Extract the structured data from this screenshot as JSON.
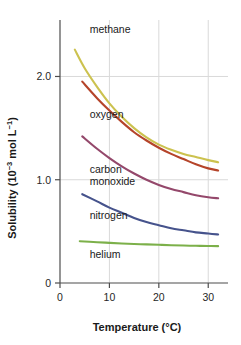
{
  "chart_data": {
    "type": "line",
    "title": "",
    "xlabel": "Temperature (°C)",
    "ylabel": "Solubility (10⁻³ mol L⁻¹)",
    "ylabel_parts": {
      "prefix": "Solubility (10",
      "exp1": "−3",
      "mid": " mol L",
      "exp2": "−1",
      "suffix": ")"
    },
    "xlim": [
      0,
      34
    ],
    "ylim": [
      0,
      2.45
    ],
    "xticks": [
      0,
      10,
      20,
      30
    ],
    "xtick_labels": [
      "0",
      "10",
      "20",
      "30"
    ],
    "yticks": [
      0,
      1.0,
      2.0
    ],
    "ytick_labels": [
      "0",
      "1.0",
      "2.0"
    ],
    "grid": true,
    "grid_color": "#d9d9d9",
    "axis_color": "#4d4d4d",
    "legend": "inline-labels",
    "series": [
      {
        "name": "methane",
        "label": "methane",
        "color": "#ccc24f",
        "x": [
          3.0,
          5,
          7.5,
          10,
          12.5,
          15,
          17.5,
          20,
          22.5,
          25,
          27.5,
          30,
          32.0
        ],
        "values": [
          2.26,
          2.08,
          1.9,
          1.74,
          1.61,
          1.5,
          1.41,
          1.34,
          1.29,
          1.25,
          1.22,
          1.19,
          1.17
        ],
        "label_x": 6.0,
        "label_y": 2.42
      },
      {
        "name": "oxygen",
        "label": "oxygen",
        "color": "#b5442a",
        "x": [
          4.5,
          7.5,
          10,
          12.5,
          15,
          17.5,
          20,
          22.5,
          25,
          27.5,
          30,
          32.0
        ],
        "values": [
          1.95,
          1.79,
          1.67,
          1.56,
          1.46,
          1.38,
          1.31,
          1.25,
          1.2,
          1.15,
          1.11,
          1.09
        ],
        "label_x": 6.0,
        "label_y": 1.6
      },
      {
        "name": "carbon monoxide",
        "label": "carbon\nmonoxide",
        "label_line1": "carbon",
        "label_line2": "monoxide",
        "color": "#94486b",
        "x": [
          4.5,
          7.5,
          10,
          12.5,
          15,
          17.5,
          20,
          22.5,
          25,
          27.5,
          30,
          32.0
        ],
        "values": [
          1.42,
          1.3,
          1.21,
          1.13,
          1.06,
          1.0,
          0.95,
          0.91,
          0.88,
          0.85,
          0.83,
          0.82
        ],
        "label_x": 6.0,
        "label_y": 1.07
      },
      {
        "name": "nitrogen",
        "label": "nitrogen",
        "color": "#46538c",
        "x": [
          4.5,
          7.5,
          10,
          12.5,
          15,
          17.5,
          20,
          22.5,
          25,
          27.5,
          30,
          32.0
        ],
        "values": [
          0.86,
          0.79,
          0.73,
          0.68,
          0.63,
          0.59,
          0.56,
          0.53,
          0.51,
          0.49,
          0.48,
          0.47
        ],
        "label_x": 6.0,
        "label_y": 0.62
      },
      {
        "name": "helium",
        "label": "helium",
        "color": "#7cb04a",
        "x": [
          4.0,
          7.5,
          10,
          12.5,
          15,
          17.5,
          20,
          22.5,
          25,
          27.5,
          30,
          32.0
        ],
        "values": [
          0.405,
          0.395,
          0.389,
          0.383,
          0.378,
          0.374,
          0.37,
          0.366,
          0.363,
          0.36,
          0.358,
          0.357
        ],
        "label_x": 6.0,
        "label_y": 0.24
      }
    ]
  }
}
